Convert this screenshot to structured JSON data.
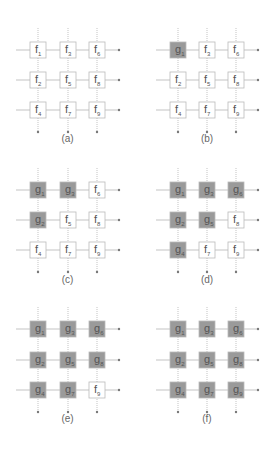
{
  "colors": {
    "g_fill": "#9a9a9a",
    "f_fill": "#ffffff",
    "stroke": "#bbbbbb",
    "line": "#aaaaaa",
    "text": "#555555"
  },
  "grid_indices": [
    [
      1,
      3,
      6
    ],
    [
      2,
      5,
      8
    ],
    [
      4,
      7,
      9
    ]
  ],
  "panels": [
    {
      "caption": "(a)",
      "cells": [
        [
          "f",
          "f",
          "f"
        ],
        [
          "f",
          "f",
          "f"
        ],
        [
          "f",
          "f",
          "f"
        ]
      ]
    },
    {
      "caption": "(b)",
      "cells": [
        [
          "g",
          "f",
          "f"
        ],
        [
          "f",
          "f",
          "f"
        ],
        [
          "f",
          "f",
          "f"
        ]
      ]
    },
    {
      "caption": "(c)",
      "cells": [
        [
          "g",
          "g",
          "f"
        ],
        [
          "g",
          "f",
          "f"
        ],
        [
          "f",
          "f",
          "f"
        ]
      ]
    },
    {
      "caption": "(d)",
      "cells": [
        [
          "g",
          "g",
          "g"
        ],
        [
          "g",
          "g",
          "f"
        ],
        [
          "g",
          "f",
          "f"
        ]
      ]
    },
    {
      "caption": "(e)",
      "cells": [
        [
          "g",
          "g",
          "g"
        ],
        [
          "g",
          "g",
          "g"
        ],
        [
          "g",
          "g",
          "f"
        ]
      ]
    },
    {
      "caption": "(f)",
      "cells": [
        [
          "g",
          "g",
          "g"
        ],
        [
          "g",
          "g",
          "g"
        ],
        [
          "g",
          "g",
          "g"
        ]
      ]
    }
  ]
}
